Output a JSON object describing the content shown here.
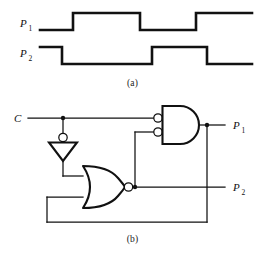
{
  "figure": {
    "type": "logic-circuit-with-timing-diagram",
    "width": 265,
    "height": 257,
    "ink_color": "#111111",
    "background_color": "#ffffff"
  },
  "panel_a": {
    "caption": "(a)",
    "kind": "timing-diagram",
    "signals": [
      {
        "name": "P",
        "subscript": "1",
        "label": "P1",
        "initial_level": "low",
        "transitions_px": [
          73,
          140,
          196
        ],
        "segments": [
          {
            "level": "low",
            "from_px": 40,
            "to_px": 73
          },
          {
            "level": "high",
            "from_px": 73,
            "to_px": 140
          },
          {
            "level": "low",
            "from_px": 140,
            "to_px": 196
          },
          {
            "level": "high",
            "from_px": 196,
            "to_px": 252
          }
        ]
      },
      {
        "name": "P",
        "subscript": "2",
        "label": "P2",
        "initial_level": "high",
        "transitions_px": [
          62,
          152,
          207
        ],
        "segments": [
          {
            "level": "high",
            "from_px": 40,
            "to_px": 62
          },
          {
            "level": "low",
            "from_px": 62,
            "to_px": 152
          },
          {
            "level": "high",
            "from_px": 152,
            "to_px": 207
          },
          {
            "level": "low",
            "from_px": 207,
            "to_px": 252
          }
        ]
      }
    ]
  },
  "panel_b": {
    "caption": "(b)",
    "kind": "logic-schematic",
    "inputs": [
      {
        "label": "C",
        "name": "clock-input"
      }
    ],
    "outputs": [
      {
        "name": "P",
        "subscript": "1",
        "label": "P1"
      },
      {
        "name": "P",
        "subscript": "2",
        "label": "P2"
      }
    ],
    "gates": [
      {
        "id": "inverter",
        "type": "NOT",
        "orientation": "down",
        "bubble": "input",
        "label": "inverter-gate"
      },
      {
        "id": "nor",
        "type": "NOR",
        "orientation": "right",
        "bubble": "output",
        "inputs": 2,
        "label": "nor-gate"
      },
      {
        "id": "and",
        "type": "AND",
        "orientation": "right",
        "bubble": "both-inputs",
        "inputs": 2,
        "label": "and-gate-inverted-inputs"
      }
    ],
    "nets": [
      {
        "from": "C",
        "to": "and.in1",
        "note": "clock to inverted AND input"
      },
      {
        "from": "C",
        "to": "inverter.in",
        "note": "tap at junction dot"
      },
      {
        "from": "inverter.out",
        "to": "nor.in1"
      },
      {
        "from": "nor.out",
        "to": "and.in2",
        "note": "routed up"
      },
      {
        "from": "nor.out",
        "to": "P2"
      },
      {
        "from": "and.out",
        "to": "P1"
      },
      {
        "from": "P1",
        "to": "nor.in2",
        "note": "feedback via bottom rail"
      }
    ],
    "junction_dots": 4
  }
}
